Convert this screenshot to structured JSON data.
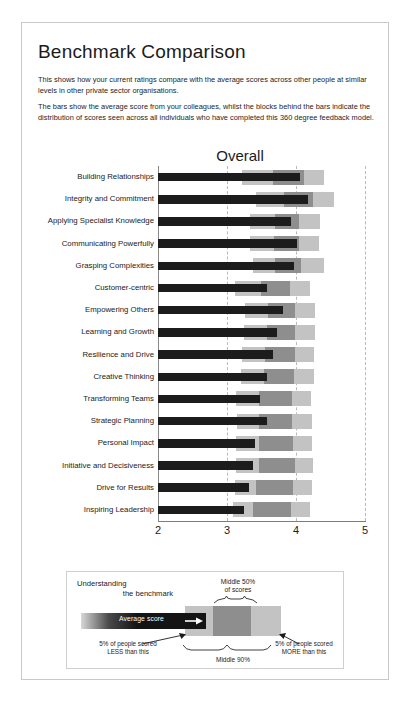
{
  "document": {
    "title": "Benchmark Comparison",
    "paragraph_1": "This shows how your current ratings compare with the average scores across other people at similar levels in other private sector organisations.",
    "paragraph_2": "The bars show the average score from your colleagues, whilst the blocks behind the bars indicate the distribution of scores seen across all individuals who have completed this 360 degree feedback model."
  },
  "legend": {
    "title_line1": "Understanding",
    "title_line2": "the benchmark",
    "middle50_line1": "Middle 50%",
    "middle50_line2": "of scores",
    "average_score_label": "Average score",
    "arrow_icon": "right-arrow-icon",
    "left_note": "5% of people scored LESS than this",
    "right_note": "5% of people scored MORE than this",
    "middle90_label": "Middle 90%"
  },
  "colors": {
    "band_90": "#c3c3c3",
    "band_50": "#8e8e8e",
    "average_bar": "#1c1c1c",
    "gridline": "#b9b9b9",
    "axis": "#7d7d7d",
    "border": "#c9c9c9"
  },
  "chart_data": {
    "type": "bar",
    "title": "Overall",
    "xlabel": "",
    "ylabel": "",
    "xlim": [
      2,
      5
    ],
    "ticks": [
      2,
      3,
      4,
      5
    ],
    "grid": true,
    "legend_position": "below-chart",
    "categories": [
      "Building Relationships",
      "Integrity and Commitment",
      "Applying Specialist Knowledge",
      "Communicating Powerfully",
      "Grasping Complexities",
      "Customer-centric",
      "Empowering Others",
      "Learning and Growth",
      "Resilience and Drive",
      "Creative Thinking",
      "Transforming Teams",
      "Strategic Planning",
      "Personal Impact",
      "Initiative and Decisiveness",
      "Drive for Results",
      "Inspiring Leadership"
    ],
    "series": [
      {
        "name": "Average score",
        "values": [
          4.06,
          4.18,
          3.93,
          4.02,
          3.97,
          3.58,
          3.81,
          3.72,
          3.66,
          3.58,
          3.48,
          3.58,
          3.4,
          3.38,
          3.32,
          3.25
        ]
      },
      {
        "name": "Middle 50% of scores",
        "lower": [
          3.66,
          3.82,
          3.7,
          3.68,
          3.7,
          3.49,
          3.6,
          3.58,
          3.55,
          3.53,
          3.46,
          3.47,
          3.46,
          3.46,
          3.42,
          3.37
        ],
        "upper": [
          4.12,
          4.25,
          4.05,
          4.05,
          4.07,
          3.92,
          3.98,
          3.99,
          3.98,
          3.97,
          3.94,
          3.94,
          3.96,
          3.98,
          3.96,
          3.93
        ]
      },
      {
        "name": "Middle 90% of scores",
        "lower": [
          3.22,
          3.42,
          3.34,
          3.34,
          3.38,
          3.12,
          3.26,
          3.24,
          3.22,
          3.2,
          3.13,
          3.15,
          3.13,
          3.13,
          3.11,
          3.08
        ],
        "upper": [
          4.4,
          4.55,
          4.35,
          4.34,
          4.4,
          4.2,
          4.27,
          4.27,
          4.26,
          4.26,
          4.22,
          4.23,
          4.23,
          4.25,
          4.23,
          4.2
        ]
      }
    ]
  }
}
